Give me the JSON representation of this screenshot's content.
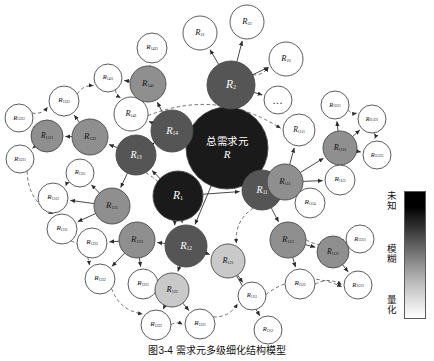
{
  "figure": {
    "caption": "图3-4  需求元多级细化结构模型",
    "center_cn": "总需求元",
    "center_symbol": "R",
    "ellipsis_glyph": "…"
  },
  "legend": {
    "top_label": "未知",
    "mid_label": "模糊",
    "bottom_label": "量化",
    "gradient_from": "#000000",
    "gradient_to": "#ffffff"
  },
  "palette": {
    "unknown": "#1a1a1a",
    "dark": "#555555",
    "mid": "#8f8f8f",
    "light": "#c9c9c9",
    "white": "#ffffff",
    "stroke": "#4a4a4a",
    "edge_solid": "#333333",
    "edge_dashed": "#555555"
  },
  "chart_data": {
    "type": "diagram",
    "title": "需求元多级细化结构模型",
    "layout": "radial hierarchy with dashed lateral correlation links",
    "shading_meaning": {
      "darkest": "未知",
      "middle": "模糊",
      "lightest": "量化"
    },
    "nodes": [
      {
        "id": "R",
        "label": "R",
        "sub": "",
        "x": 227,
        "y": 148,
        "r": 41,
        "shade": "unknown",
        "text": "dark"
      },
      {
        "id": "R1",
        "label": "R",
        "sub": "1",
        "x": 178,
        "y": 196,
        "r": 25,
        "shade": "unknown",
        "text": "dark"
      },
      {
        "id": "R2",
        "label": "R",
        "sub": "2",
        "x": 231,
        "y": 85,
        "r": 24,
        "shade": "dark",
        "text": "dark"
      },
      {
        "id": "R21",
        "label": "R",
        "sub": "21",
        "x": 200,
        "y": 33,
        "r": 17,
        "shade": "white",
        "text": "light"
      },
      {
        "id": "R22",
        "label": "R",
        "sub": "22",
        "x": 247,
        "y": 22,
        "r": 17,
        "shade": "white",
        "text": "light"
      },
      {
        "id": "R23",
        "label": "R",
        "sub": "23",
        "x": 286,
        "y": 59,
        "r": 17,
        "shade": "white",
        "text": "light"
      },
      {
        "id": "Rdots",
        "label": "…",
        "sub": "",
        "x": 278,
        "y": 100,
        "r": 14,
        "shade": "white",
        "text": "light"
      },
      {
        "id": "R14",
        "label": "R",
        "sub": "14",
        "x": 172,
        "y": 131,
        "r": 21,
        "shade": "dark",
        "text": "dark"
      },
      {
        "id": "R141",
        "label": "R",
        "sub": "141",
        "x": 131,
        "y": 114,
        "r": 17,
        "shade": "white",
        "text": "light"
      },
      {
        "id": "R142",
        "label": "R",
        "sub": "142",
        "x": 148,
        "y": 84,
        "r": 18,
        "shade": "mid",
        "text": "light"
      },
      {
        "id": "R1421",
        "label": "R",
        "sub": "1421",
        "x": 108,
        "y": 78,
        "r": 14,
        "shade": "white",
        "text": "light"
      },
      {
        "id": "R1422",
        "label": "R",
        "sub": "1422",
        "x": 152,
        "y": 48,
        "r": 15,
        "shade": "white",
        "text": "light"
      },
      {
        "id": "R13",
        "label": "R",
        "sub": "13",
        "x": 136,
        "y": 155,
        "r": 20,
        "shade": "dark",
        "text": "dark"
      },
      {
        "id": "R132",
        "label": "R",
        "sub": "132",
        "x": 90,
        "y": 137,
        "r": 18,
        "shade": "mid",
        "text": "light"
      },
      {
        "id": "R1321",
        "label": "R",
        "sub": "1321",
        "x": 47,
        "y": 136,
        "r": 16,
        "shade": "mid",
        "text": "light"
      },
      {
        "id": "R13211",
        "label": "R",
        "sub": "13211",
        "x": 20,
        "y": 159,
        "r": 14,
        "shade": "white",
        "text": "light"
      },
      {
        "id": "R13212",
        "label": "R",
        "sub": "13212",
        "x": 19,
        "y": 118,
        "r": 14,
        "shade": "white",
        "text": "light"
      },
      {
        "id": "R1322",
        "label": "R",
        "sub": "1322",
        "x": 64,
        "y": 101,
        "r": 15,
        "shade": "white",
        "text": "light"
      },
      {
        "id": "R131",
        "label": "R",
        "sub": "131",
        "x": 112,
        "y": 206,
        "r": 18,
        "shade": "mid",
        "text": "light"
      },
      {
        "id": "R1311",
        "label": "R",
        "sub": "1311",
        "x": 62,
        "y": 229,
        "r": 15,
        "shade": "white",
        "text": "light"
      },
      {
        "id": "R1312",
        "label": "R",
        "sub": "1312",
        "x": 53,
        "y": 198,
        "r": 15,
        "shade": "white",
        "text": "light"
      },
      {
        "id": "R1313",
        "label": "R",
        "sub": "1313",
        "x": 80,
        "y": 173,
        "r": 14,
        "shade": "white",
        "text": "light"
      },
      {
        "id": "R12",
        "label": "R",
        "sub": "12",
        "x": 186,
        "y": 246,
        "r": 21,
        "shade": "dark",
        "text": "dark"
      },
      {
        "id": "R123",
        "label": "R",
        "sub": "123",
        "x": 137,
        "y": 240,
        "r": 18,
        "shade": "mid",
        "text": "light"
      },
      {
        "id": "R1230",
        "label": "R",
        "sub": "1233",
        "x": 92,
        "y": 243,
        "r": 15,
        "shade": "white",
        "text": "light"
      },
      {
        "id": "R1232",
        "label": "R",
        "sub": "1232",
        "x": 100,
        "y": 279,
        "r": 15,
        "shade": "white",
        "text": "light"
      },
      {
        "id": "R1231",
        "label": "R",
        "sub": "1231",
        "x": 143,
        "y": 284,
        "r": 15,
        "shade": "white",
        "text": "light"
      },
      {
        "id": "R122",
        "label": "R",
        "sub": "122",
        "x": 172,
        "y": 290,
        "r": 17,
        "shade": "light",
        "text": "light"
      },
      {
        "id": "R1222",
        "label": "R",
        "sub": "1222",
        "x": 156,
        "y": 325,
        "r": 15,
        "shade": "white",
        "text": "light"
      },
      {
        "id": "R1221",
        "label": "R",
        "sub": "1221",
        "x": 200,
        "y": 324,
        "r": 15,
        "shade": "white",
        "text": "light"
      },
      {
        "id": "R121",
        "label": "R",
        "sub": "121",
        "x": 228,
        "y": 261,
        "r": 17,
        "shade": "light",
        "text": "light"
      },
      {
        "id": "R1211",
        "label": "R",
        "sub": "1211",
        "x": 252,
        "y": 296,
        "r": 14,
        "shade": "white",
        "text": "light"
      },
      {
        "id": "R1212",
        "label": "R",
        "sub": "1212",
        "x": 268,
        "y": 330,
        "r": 14,
        "shade": "white",
        "text": "light"
      },
      {
        "id": "R11",
        "label": "R",
        "sub": "11",
        "x": 262,
        "y": 190,
        "r": 20,
        "shade": "dark",
        "text": "dark"
      },
      {
        "id": "R111",
        "label": "R",
        "sub": "111",
        "x": 285,
        "y": 182,
        "r": 18,
        "shade": "mid",
        "text": "light"
      },
      {
        "id": "R1111",
        "label": "R",
        "sub": "1111",
        "x": 299,
        "y": 130,
        "r": 16,
        "shade": "white",
        "text": "light"
      },
      {
        "id": "R1112",
        "label": "R",
        "sub": "1112",
        "x": 340,
        "y": 148,
        "r": 17,
        "shade": "mid",
        "text": "light"
      },
      {
        "id": "R11121",
        "label": "R",
        "sub": "11121",
        "x": 335,
        "y": 105,
        "r": 14,
        "shade": "white",
        "text": "light"
      },
      {
        "id": "R111221",
        "label": "R",
        "sub": "111221",
        "x": 372,
        "y": 119,
        "r": 14,
        "shade": "white",
        "text": "light"
      },
      {
        "id": "R111222",
        "label": "R",
        "sub": "111222",
        "x": 377,
        "y": 155,
        "r": 14,
        "shade": "white",
        "text": "light"
      },
      {
        "id": "R1113",
        "label": "R",
        "sub": "1113",
        "x": 340,
        "y": 180,
        "r": 15,
        "shade": "white",
        "text": "light"
      },
      {
        "id": "R1114",
        "label": "R",
        "sub": "1114",
        "x": 310,
        "y": 203,
        "r": 15,
        "shade": "white",
        "text": "light"
      },
      {
        "id": "R112",
        "label": "R",
        "sub": "112",
        "x": 288,
        "y": 240,
        "r": 18,
        "shade": "mid",
        "text": "light"
      },
      {
        "id": "R1121",
        "label": "R",
        "sub": "1121",
        "x": 333,
        "y": 252,
        "r": 16,
        "shade": "mid",
        "text": "light"
      },
      {
        "id": "R11211",
        "label": "R",
        "sub": "11211",
        "x": 360,
        "y": 239,
        "r": 14,
        "shade": "white",
        "text": "light"
      },
      {
        "id": "R11212",
        "label": "R",
        "sub": "11212",
        "x": 358,
        "y": 285,
        "r": 14,
        "shade": "white",
        "text": "light"
      },
      {
        "id": "R1122",
        "label": "R",
        "sub": "1122",
        "x": 300,
        "y": 284,
        "r": 15,
        "shade": "white",
        "text": "light"
      }
    ],
    "solid_edges": [
      [
        "R",
        "R1"
      ],
      [
        "R",
        "R2"
      ],
      [
        "R",
        "R14"
      ],
      [
        "R",
        "R11"
      ],
      [
        "R",
        "R12"
      ],
      [
        "R2",
        "R21"
      ],
      [
        "R2",
        "R22"
      ],
      [
        "R2",
        "R23"
      ],
      [
        "R2",
        "Rdots"
      ],
      [
        "R14",
        "R141"
      ],
      [
        "R14",
        "R142"
      ],
      [
        "R142",
        "R1421"
      ],
      [
        "R142",
        "R1422"
      ],
      [
        "R1",
        "R13"
      ],
      [
        "R1",
        "R12"
      ],
      [
        "R13",
        "R132"
      ],
      [
        "R132",
        "R1321"
      ],
      [
        "R1321",
        "R13211"
      ],
      [
        "R1321",
        "R13212"
      ],
      [
        "R132",
        "R1322"
      ],
      [
        "R13",
        "R131"
      ],
      [
        "R131",
        "R1311"
      ],
      [
        "R131",
        "R1312"
      ],
      [
        "R131",
        "R1313"
      ],
      [
        "R12",
        "R123"
      ],
      [
        "R123",
        "R1230"
      ],
      [
        "R123",
        "R1232"
      ],
      [
        "R123",
        "R1231"
      ],
      [
        "R12",
        "R122"
      ],
      [
        "R122",
        "R1222"
      ],
      [
        "R122",
        "R1221"
      ],
      [
        "R12",
        "R121"
      ],
      [
        "R121",
        "R1211"
      ],
      [
        "R121",
        "R1212"
      ],
      [
        "R11",
        "R111"
      ],
      [
        "R111",
        "R1111"
      ],
      [
        "R111",
        "R1112"
      ],
      [
        "R1112",
        "R11121"
      ],
      [
        "R1112",
        "R111221"
      ],
      [
        "R1112",
        "R111222"
      ],
      [
        "R111",
        "R1113"
      ],
      [
        "R111",
        "R1114"
      ],
      [
        "R11",
        "R112"
      ],
      [
        "R112",
        "R1121"
      ],
      [
        "R1121",
        "R11211"
      ],
      [
        "R1121",
        "R11212"
      ],
      [
        "R112",
        "R1122"
      ],
      [
        "R1",
        "R11"
      ],
      [
        "R14",
        "R13"
      ]
    ],
    "dashed_edges": [
      [
        "R13212",
        "R1322"
      ],
      [
        "R1322",
        "R1421"
      ],
      [
        "R1421",
        "R141"
      ],
      [
        "R141",
        "R1111"
      ],
      [
        "R11121",
        "R111221"
      ],
      [
        "R111221",
        "R111222"
      ],
      [
        "R13211",
        "R1311"
      ],
      [
        "R1311",
        "R1232"
      ],
      [
        "R1232",
        "R1222"
      ],
      [
        "R1222",
        "R1221"
      ],
      [
        "R1221",
        "R1211"
      ],
      [
        "R1211",
        "R11212"
      ],
      [
        "R1313",
        "R1312"
      ],
      [
        "R1231",
        "R122"
      ],
      [
        "R112",
        "R11211"
      ],
      [
        "R1122",
        "R11212"
      ],
      [
        "R2",
        "R23"
      ],
      [
        "R13",
        "R12"
      ],
      [
        "R11",
        "R121"
      ]
    ]
  }
}
